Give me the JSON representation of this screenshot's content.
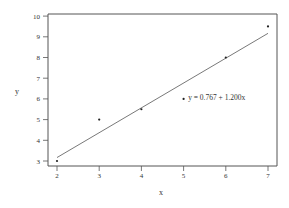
{
  "chart_data": {
    "type": "scatter",
    "title": "",
    "xlabel": "x",
    "ylabel": "y",
    "xlim": [
      1.78,
      7.22
    ],
    "ylim": [
      2.76,
      10.1
    ],
    "x_ticks": [
      2,
      3,
      4,
      5,
      6,
      7
    ],
    "y_ticks": [
      3,
      4,
      5,
      6,
      7,
      8,
      9,
      10
    ],
    "grid": false,
    "legend": null,
    "series": [
      {
        "name": "observations",
        "type": "scatter",
        "x": [
          2,
          3,
          4,
          5,
          6,
          7
        ],
        "y": [
          3,
          5,
          5.5,
          6,
          8,
          9.5
        ]
      },
      {
        "name": "fitted line",
        "type": "line",
        "intercept": 0.767,
        "slope": 1.2,
        "x": [
          2,
          7
        ],
        "y": [
          3.167,
          9.167
        ]
      }
    ],
    "annotations": [
      {
        "text": "y = 0.767 + 1.200x",
        "x": 5.25,
        "y": 6.05
      }
    ]
  },
  "colors": {
    "axis": "#555555",
    "line": "#555555",
    "point": "#222222",
    "text": "#333333"
  }
}
